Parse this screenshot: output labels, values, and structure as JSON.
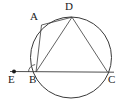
{
  "figure": {
    "background_color": "#ffffff",
    "stroke_color": "#3a3a3a",
    "label_color": "#1a1a1a",
    "width": 124,
    "height": 103
  },
  "circle": {
    "name": "circumscribed-circle",
    "cx": 71,
    "cy": 57.5,
    "r": 40.5,
    "stroke": "#3a3a3a",
    "stroke_width": 1
  },
  "points": [
    {
      "id": "A",
      "label": "A",
      "x": 41.5,
      "y": 25.0,
      "on_circle": true,
      "label_x": 30,
      "label_y": 11
    },
    {
      "id": "D",
      "label": "D",
      "x": 72.0,
      "y": 17.2,
      "on_circle": true,
      "label_x": 65,
      "label_y": 1
    },
    {
      "id": "B",
      "label": "B",
      "x": 36.0,
      "y": 72.0,
      "on_circle": true,
      "label_x": 29,
      "label_y": 74
    },
    {
      "id": "C",
      "label": "C",
      "x": 107.5,
      "y": 72.0,
      "on_circle": true,
      "label_x": 108,
      "label_y": 74
    },
    {
      "id": "E",
      "label": "E",
      "x": 14.0,
      "y": 71.5,
      "on_circle": false,
      "label_x": 8,
      "label_y": 74
    }
  ],
  "marked_point": {
    "name": "point-E-dot",
    "id": "E",
    "x": 14.0,
    "y": 71.5,
    "radius": 2.0,
    "fill": "#1a1a1a"
  },
  "segments": [
    {
      "name": "chord-AD",
      "from": "A",
      "to": "D",
      "x1": 41.5,
      "y1": 25.0,
      "x2": 72.0,
      "y2": 17.2
    },
    {
      "name": "chord-AB",
      "from": "A",
      "to": "B",
      "x1": 41.5,
      "y1": 25.0,
      "x2": 36.0,
      "y2": 72.0
    },
    {
      "name": "chord-DB",
      "from": "D",
      "to": "B",
      "x1": 72.0,
      "y1": 17.2,
      "x2": 36.0,
      "y2": 72.0
    },
    {
      "name": "chord-DC",
      "from": "D",
      "to": "C",
      "x1": 72.0,
      "y1": 17.2,
      "x2": 107.5,
      "y2": 72.0
    }
  ],
  "secant_line": {
    "name": "line-EBC",
    "through": "E, B, C",
    "x1": 10.0,
    "y1": 71.5,
    "x2": 114.0,
    "y2": 72.2
  },
  "angle_mark": {
    "name": "angle-mark-at-B",
    "at": "B",
    "between": "BA and BE",
    "cx": 36.0,
    "cy": 72.0,
    "radius": 7.5,
    "start_deg": 180,
    "end_deg": 263
  }
}
